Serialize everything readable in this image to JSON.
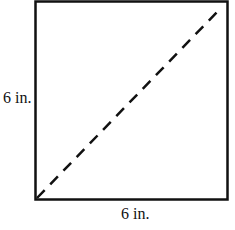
{
  "figure": {
    "shape": "square",
    "side_left_label": "6 in.",
    "side_bottom_label": "6 in.",
    "diagonal_style": "dashed",
    "stroke_color": "#111111"
  }
}
